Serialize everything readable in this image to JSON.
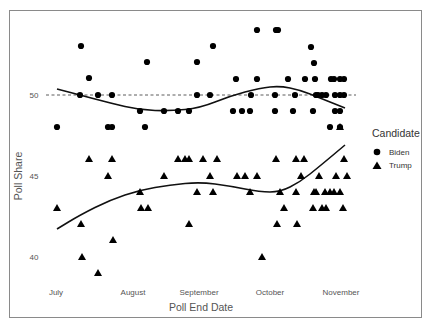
{
  "chart_data": {
    "type": "scatter",
    "title": "",
    "xlabel": "Poll End Date",
    "ylabel": "Poll Share",
    "x_ticks": [
      "July",
      "August",
      "September",
      "October",
      "November"
    ],
    "y_ticks": [
      40,
      45,
      50
    ],
    "ylim": [
      38.5,
      55
    ],
    "reference_line": {
      "y": 50,
      "style": "dashed"
    },
    "legend": {
      "title": "Candidate",
      "position": "right",
      "entries": [
        "Biden",
        "Trump"
      ]
    },
    "grid": false,
    "series": [
      {
        "name": "Biden",
        "marker": "circle",
        "points_px": [
          [
            57,
            127
          ],
          [
            81,
            46
          ],
          [
            80,
            95
          ],
          [
            89,
            78
          ],
          [
            98,
            95
          ],
          [
            108,
            127
          ],
          [
            112,
            127
          ],
          [
            112,
            95
          ],
          [
            140,
            111
          ],
          [
            145,
            127
          ],
          [
            147,
            62
          ],
          [
            164,
            111
          ],
          [
            178,
            111
          ],
          [
            189,
            111
          ],
          [
            197,
            62
          ],
          [
            210,
            95
          ],
          [
            213,
            46
          ],
          [
            197,
            95
          ],
          [
            233,
            111
          ],
          [
            236,
            79
          ],
          [
            242,
            111
          ],
          [
            250,
            111
          ],
          [
            251,
            95
          ],
          [
            257,
            30
          ],
          [
            257,
            79
          ],
          [
            276,
            30
          ],
          [
            278,
            30
          ],
          [
            275,
            95
          ],
          [
            275,
            111
          ],
          [
            288,
            79
          ],
          [
            293,
            111
          ],
          [
            295,
            95
          ],
          [
            305,
            79
          ],
          [
            315,
            79
          ],
          [
            316,
            95
          ],
          [
            311,
            47
          ],
          [
            314,
            63
          ],
          [
            313,
            111
          ],
          [
            318,
            95
          ],
          [
            322,
            95
          ],
          [
            326,
            95
          ],
          [
            331,
            79
          ],
          [
            334,
            79
          ],
          [
            340,
            79
          ],
          [
            335,
            95
          ],
          [
            340,
            95
          ],
          [
            335,
            111
          ],
          [
            340,
            111
          ],
          [
            330,
            127
          ],
          [
            340,
            127
          ],
          [
            344,
            79
          ],
          [
            344,
            95
          ]
        ],
        "values_poll_share": [
          48,
          53,
          50,
          51,
          50,
          48,
          48,
          50,
          49,
          48,
          52,
          49,
          49,
          49,
          52,
          50,
          53,
          50,
          49,
          51,
          49,
          49,
          50,
          54,
          51,
          54,
          54,
          50,
          49,
          51,
          49,
          50,
          51,
          51,
          50,
          53,
          52,
          49,
          50,
          50,
          50,
          51,
          51,
          51,
          50,
          50,
          49,
          49,
          48,
          48,
          51,
          50
        ],
        "smooth_curve": [
          [
            57,
            89
          ],
          [
            80,
            95
          ],
          [
            110,
            103
          ],
          [
            140,
            110
          ],
          [
            170,
            111
          ],
          [
            200,
            108
          ],
          [
            230,
            96
          ],
          [
            260,
            88
          ],
          [
            280,
            86
          ],
          [
            300,
            90
          ],
          [
            320,
            98
          ],
          [
            345,
            108
          ]
        ]
      },
      {
        "name": "Trump",
        "marker": "triangle",
        "points_px": [
          [
            57,
            208
          ],
          [
            81,
            224
          ],
          [
            82,
            257
          ],
          [
            89,
            159
          ],
          [
            98,
            273
          ],
          [
            108,
            176
          ],
          [
            112,
            159
          ],
          [
            113,
            240
          ],
          [
            140,
            192
          ],
          [
            141,
            208
          ],
          [
            148,
            208
          ],
          [
            164,
            176
          ],
          [
            178,
            159
          ],
          [
            185,
            159
          ],
          [
            189,
            224
          ],
          [
            189,
            159
          ],
          [
            197,
            192
          ],
          [
            203,
            159
          ],
          [
            210,
            176
          ],
          [
            213,
            192
          ],
          [
            217,
            159
          ],
          [
            237,
            176
          ],
          [
            245,
            176
          ],
          [
            257,
            176
          ],
          [
            250,
            192
          ],
          [
            262,
            257
          ],
          [
            276,
            159
          ],
          [
            277,
            224
          ],
          [
            280,
            192
          ],
          [
            284,
            208
          ],
          [
            296,
            192
          ],
          [
            296,
            159
          ],
          [
            297,
            224
          ],
          [
            301,
            176
          ],
          [
            304,
            159
          ],
          [
            314,
            192
          ],
          [
            313,
            208
          ],
          [
            316,
            192
          ],
          [
            319,
            176
          ],
          [
            322,
            208
          ],
          [
            325,
            192
          ],
          [
            326,
            208
          ],
          [
            330,
            192
          ],
          [
            334,
            192
          ],
          [
            336,
            176
          ],
          [
            340,
            192
          ],
          [
            343,
            208
          ],
          [
            344,
            159
          ],
          [
            347,
            176
          ],
          [
            340,
            127
          ]
        ],
        "values_poll_share": [
          43,
          42,
          40,
          46,
          39,
          45,
          46,
          41,
          44,
          43,
          43,
          45,
          46,
          46,
          42,
          46,
          44,
          46,
          45,
          44,
          46,
          45,
          45,
          45,
          44,
          40,
          46,
          42,
          44,
          43,
          44,
          46,
          42,
          45,
          46,
          44,
          43,
          44,
          45,
          43,
          44,
          43,
          44,
          44,
          45,
          44,
          43,
          46,
          45,
          48
        ],
        "smooth_curve": [
          [
            57,
            229
          ],
          [
            80,
            215
          ],
          [
            110,
            200
          ],
          [
            140,
            190
          ],
          [
            170,
            185
          ],
          [
            200,
            182
          ],
          [
            230,
            186
          ],
          [
            260,
            192
          ],
          [
            280,
            192
          ],
          [
            300,
            182
          ],
          [
            320,
            166
          ],
          [
            345,
            145
          ]
        ]
      }
    ]
  },
  "legend": {
    "title": "Candidate",
    "items": [
      {
        "label": "Biden"
      },
      {
        "label": "Trump"
      }
    ]
  },
  "axes": {
    "xlabel": "Poll End Date",
    "ylabel": "Poll Share",
    "x_ticks": [
      "July",
      "August",
      "September",
      "October",
      "November"
    ],
    "y_ticks": [
      "40",
      "45",
      "50"
    ]
  }
}
